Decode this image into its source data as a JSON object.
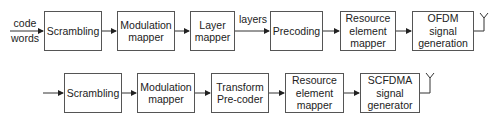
{
  "diagram": {
    "row1": {
      "input_label_line1": "code",
      "input_label_line2": "words",
      "blocks": [
        {
          "line1": "Scrambling",
          "line2": ""
        },
        {
          "line1": "Modulation",
          "line2": "mapper"
        },
        {
          "line1": "Layer",
          "line2": "mapper"
        },
        {
          "line1": "Precoding",
          "line2": ""
        },
        {
          "line1": "Resource",
          "line2": "element",
          "line3": "mapper"
        },
        {
          "line1": "OFDM signal",
          "line2": "generation"
        }
      ],
      "edge_label": "layers",
      "output": "antenna"
    },
    "row2": {
      "blocks": [
        {
          "line1": "Scrambling",
          "line2": ""
        },
        {
          "line1": "Modulation",
          "line2": "mapper"
        },
        {
          "line1": "Transform",
          "line2": "Pre-coder"
        },
        {
          "line1": "Resource",
          "line2": "element",
          "line3": "mapper"
        },
        {
          "line1": "SCFDMA",
          "line2": "signal",
          "line3": "generator"
        }
      ],
      "output": "antenna"
    }
  }
}
